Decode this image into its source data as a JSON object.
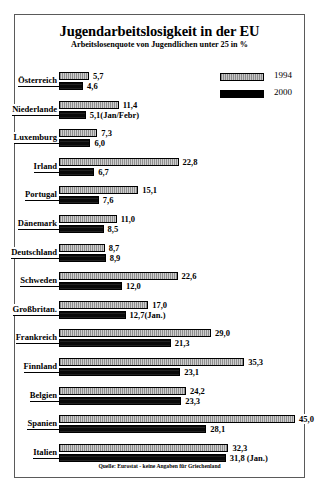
{
  "chart_data": {
    "type": "bar",
    "orientation": "horizontal",
    "title": "Jugendarbeitslosigkeit in der EU",
    "subtitle": "Arbeitslosenquote von Jugendlichen unter 25 in %",
    "xlabel": "",
    "ylabel": "",
    "xlim": [
      0,
      45
    ],
    "grid": false,
    "legend_position": "top-right",
    "source_note": "Quelle: Eurostat - keine Angaben für Griechenland",
    "legend": [
      {
        "name": "1994",
        "color": "#b9b9b9"
      },
      {
        "name": "2000",
        "color": "#000000"
      }
    ],
    "categories": [
      "Österreich",
      "Niederlande",
      "Luxemburg",
      "Irland",
      "Portugal",
      "Dänemark",
      "Deutschland",
      "Schweden",
      "Großbritan.",
      "Frankreich",
      "Finnland",
      "Belgien",
      "Spanien",
      "Italien"
    ],
    "series": [
      {
        "name": "1994",
        "values": [
          5.7,
          11.4,
          7.3,
          22.8,
          15.1,
          11.0,
          8.7,
          22.6,
          17.0,
          29.0,
          35.3,
          24.2,
          45.0,
          32.3
        ],
        "labels": [
          "5,7",
          "11,4",
          "7,3",
          "22,8",
          "15,1",
          "11,0",
          "8,7",
          "22,6",
          "17,0",
          "29,0",
          "35,3",
          "24,2",
          "45,0",
          "32,3"
        ]
      },
      {
        "name": "2000",
        "values": [
          4.6,
          5.1,
          6.0,
          6.7,
          7.6,
          8.5,
          8.9,
          12.0,
          12.7,
          21.3,
          23.1,
          23.3,
          28.1,
          31.8
        ],
        "labels": [
          "4,6",
          "5,1(Jan/Febr)",
          "6,0",
          "6,7",
          "7,6",
          "8,5",
          "8,9",
          "12,0",
          "12,7(Jan.)",
          "21,3",
          "23,1",
          "23,3",
          "28,1",
          "31,8 (Jan.)"
        ]
      }
    ]
  }
}
